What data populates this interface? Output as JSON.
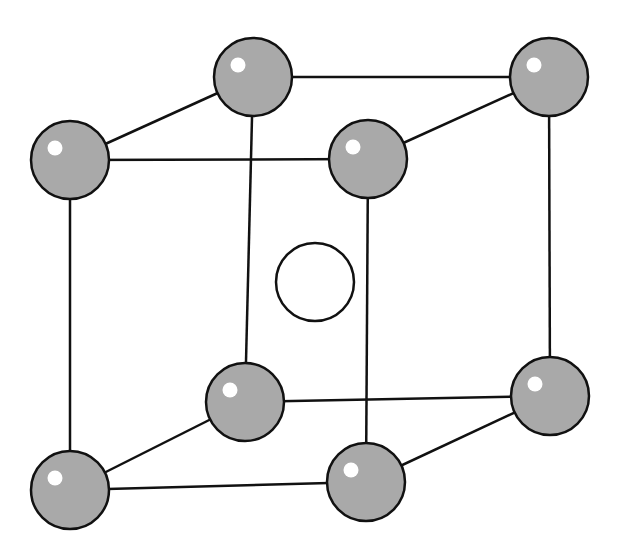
{
  "diagram": {
    "type": "body-centered cubic unit cell",
    "colors": {
      "atom_fill": "#a9a9a9",
      "atom_stroke": "#111111",
      "highlight": "#ffffff",
      "edge": "#111111",
      "center_fill": "#ffffff",
      "background": "#ffffff"
    },
    "corner_atoms": [
      {
        "id": "top-back-left",
        "cx": 253,
        "cy": 77,
        "r": 39
      },
      {
        "id": "top-back-right",
        "cx": 549,
        "cy": 77,
        "r": 39
      },
      {
        "id": "top-front-left",
        "cx": 70,
        "cy": 160,
        "r": 39
      },
      {
        "id": "top-front-right",
        "cx": 368,
        "cy": 159,
        "r": 39
      },
      {
        "id": "bottom-back-left",
        "cx": 245,
        "cy": 402,
        "r": 39
      },
      {
        "id": "bottom-back-right",
        "cx": 550,
        "cy": 396,
        "r": 39
      },
      {
        "id": "bottom-front-left",
        "cx": 70,
        "cy": 490,
        "r": 39
      },
      {
        "id": "bottom-front-right",
        "cx": 366,
        "cy": 482,
        "r": 39
      }
    ],
    "center_atom": {
      "id": "body-center",
      "cx": 315,
      "cy": 282,
      "r": 39
    },
    "edges": [
      [
        "top-back-left",
        "top-back-right"
      ],
      [
        "top-front-left",
        "top-front-right"
      ],
      [
        "top-back-left",
        "top-front-left"
      ],
      [
        "top-back-right",
        "top-front-right"
      ],
      [
        "bottom-back-left",
        "bottom-back-right"
      ],
      [
        "bottom-front-left",
        "bottom-front-right"
      ],
      [
        "bottom-back-left",
        "bottom-front-left"
      ],
      [
        "bottom-back-right",
        "bottom-front-right"
      ],
      [
        "top-back-left",
        "bottom-back-left"
      ],
      [
        "top-back-right",
        "bottom-back-right"
      ],
      [
        "top-front-left",
        "bottom-front-left"
      ],
      [
        "top-front-right",
        "bottom-front-right"
      ]
    ]
  }
}
